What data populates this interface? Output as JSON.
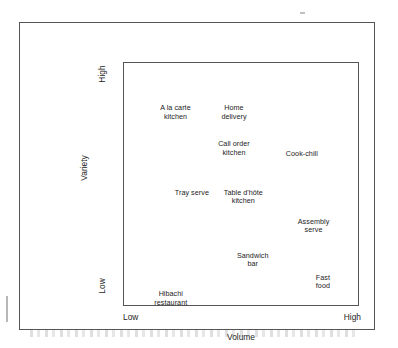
{
  "figure": {
    "type": "positioning-matrix-scatter",
    "axes": {
      "x": {
        "title": "Volume",
        "low_label": "Low",
        "high_label": "High"
      },
      "y": {
        "title": "Variety",
        "low_label": "Low",
        "high_label": "High"
      }
    }
  },
  "chart_data": {
    "type": "scatter",
    "title": "",
    "xlabel": "Volume",
    "ylabel": "Variety",
    "xlim": [
      0,
      100
    ],
    "ylim": [
      0,
      100
    ],
    "xticklabels": [
      "Low",
      "High"
    ],
    "yticklabels": [
      "Low",
      "High"
    ],
    "grid": false,
    "legend": null,
    "note": "Qualitative positioning matrix: labels only, no plotted markers. x = Volume (Low to High), y = Variety (Low to High). Values are estimated positions read off the plot box.",
    "points": [
      {
        "label": "A la carte kitchen",
        "line1": "A la carte",
        "line2": "kitchen",
        "x": 22,
        "y": 83
      },
      {
        "label": "Home delivery",
        "line1": "Home",
        "line2": "delivery",
        "x": 47,
        "y": 83
      },
      {
        "label": "Call order kitchen",
        "line1": "Call order",
        "line2": "kitchen",
        "x": 47,
        "y": 68
      },
      {
        "label": "Cook-chill",
        "line1": "Cook-chill",
        "line2": "",
        "x": 76,
        "y": 64
      },
      {
        "label": "Tray serve",
        "line1": "Tray serve",
        "line2": "",
        "x": 29,
        "y": 48
      },
      {
        "label": "Table d'hôte kitchen",
        "line1": "Table d'hôte",
        "line2": "kitchen",
        "x": 51,
        "y": 48
      },
      {
        "label": "Assembly serve",
        "line1": "Assembly",
        "line2": "serve",
        "x": 81,
        "y": 36
      },
      {
        "label": "Sandwich bar",
        "line1": "Sandwich",
        "line2": "bar",
        "x": 55,
        "y": 22
      },
      {
        "label": "Fast food",
        "line1": "Fast",
        "line2": "food",
        "x": 85,
        "y": 13
      },
      {
        "label": "Hibachi restaurant",
        "line1": "Hibachi",
        "line2": "restaurant",
        "x": 20,
        "y": 6
      }
    ]
  }
}
